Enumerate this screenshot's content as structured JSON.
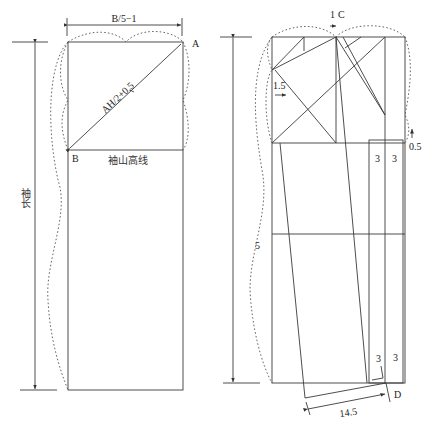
{
  "left_figure": {
    "top_dimension": "B/5−1",
    "point_a": "A",
    "point_b": "B",
    "diagonal_label": "AH/2+0.5",
    "cap_height_line_label": "袖山高线",
    "sleeve_length_label": "袖长"
  },
  "right_figure": {
    "offset_c_value": "1",
    "point_c": "C",
    "offset_1_5": "1.5",
    "offset_0_5": "0.5",
    "dim_5": "5",
    "cuff_top_left": "3",
    "cuff_top_right": "3",
    "cuff_bottom_left": "3",
    "cuff_bottom_right": "3",
    "point_d": "D",
    "cuff_width": "14.5"
  }
}
